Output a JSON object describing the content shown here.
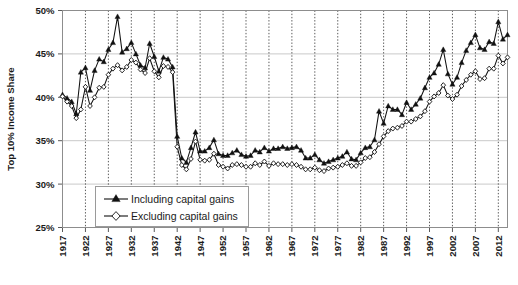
{
  "chart_data": {
    "type": "line",
    "title": "",
    "xlabel": "",
    "ylabel": "Top 10% Income Share",
    "xlim": [
      1917,
      2014
    ],
    "ylim": [
      25,
      50
    ],
    "ytick_labels": [
      "25%",
      "30%",
      "35%",
      "40%",
      "45%",
      "50%"
    ],
    "ytick_values": [
      25,
      30,
      35,
      40,
      45,
      50
    ],
    "xtick_labels": [
      "1917",
      "1922",
      "1927",
      "1932",
      "1937",
      "1942",
      "1947",
      "1952",
      "1957",
      "1962",
      "1967",
      "1972",
      "1977",
      "1982",
      "1987",
      "1992",
      "1997",
      "2002",
      "2007",
      "2012"
    ],
    "xtick_values": [
      1917,
      1922,
      1927,
      1932,
      1937,
      1942,
      1947,
      1952,
      1957,
      1962,
      1967,
      1972,
      1977,
      1982,
      1987,
      1992,
      1997,
      2002,
      2007,
      2012
    ],
    "grid": {
      "horizontal": true,
      "vertical": true,
      "vertical_style": "dotted"
    },
    "legend_position": "lower-left-inside",
    "x": [
      1917,
      1918,
      1919,
      1920,
      1921,
      1922,
      1923,
      1924,
      1925,
      1926,
      1927,
      1928,
      1929,
      1930,
      1931,
      1932,
      1933,
      1934,
      1935,
      1936,
      1937,
      1938,
      1939,
      1940,
      1941,
      1942,
      1943,
      1944,
      1945,
      1946,
      1947,
      1948,
      1949,
      1950,
      1951,
      1952,
      1953,
      1954,
      1955,
      1956,
      1957,
      1958,
      1959,
      1960,
      1961,
      1962,
      1963,
      1964,
      1965,
      1966,
      1967,
      1968,
      1969,
      1970,
      1971,
      1972,
      1973,
      1974,
      1975,
      1976,
      1977,
      1978,
      1979,
      1980,
      1981,
      1982,
      1983,
      1984,
      1985,
      1986,
      1987,
      1988,
      1989,
      1990,
      1991,
      1992,
      1993,
      1994,
      1995,
      1996,
      1997,
      1998,
      1999,
      2000,
      2001,
      2002,
      2003,
      2004,
      2005,
      2006,
      2007,
      2008,
      2009,
      2010,
      2011,
      2012,
      2013,
      2014
    ],
    "series": [
      {
        "name": "Including capital gains",
        "marker": "filled-triangle",
        "values": [
          40.3,
          39.9,
          39.5,
          38.1,
          42.9,
          43.4,
          40.8,
          43.1,
          44.4,
          44.1,
          45.5,
          46.3,
          49.3,
          45.2,
          45.6,
          46.3,
          45.0,
          43.7,
          43.4,
          46.2,
          44.7,
          43.0,
          44.6,
          44.4,
          43.5,
          35.5,
          33.0,
          32.5,
          34.2,
          36.0,
          33.8,
          33.8,
          34.2,
          35.1,
          33.5,
          33.3,
          33.3,
          33.6,
          33.9,
          33.4,
          33.2,
          33.3,
          33.9,
          33.7,
          34.2,
          33.8,
          34.1,
          34.1,
          34.3,
          34.1,
          34.2,
          34.3,
          33.9,
          33.0,
          33.0,
          33.4,
          32.8,
          32.4,
          32.6,
          32.8,
          33.0,
          33.2,
          33.7,
          32.9,
          32.8,
          33.6,
          34.2,
          34.3,
          35.1,
          38.4,
          37.0,
          39.0,
          38.6,
          38.6,
          38.0,
          39.4,
          38.6,
          39.2,
          39.9,
          41.1,
          42.3,
          42.8,
          43.8,
          45.5,
          42.7,
          41.5,
          42.3,
          44.0,
          45.4,
          46.3,
          47.2,
          45.7,
          45.5,
          46.4,
          46.2,
          48.7,
          46.7,
          47.2
        ]
      },
      {
        "name": "Excluding capital gains",
        "marker": "open-diamond",
        "values": [
          40.1,
          39.5,
          39.0,
          37.6,
          38.6,
          41.2,
          39.0,
          40.0,
          41.1,
          41.2,
          42.6,
          43.3,
          43.7,
          43.1,
          43.5,
          44.3,
          44.0,
          43.2,
          42.8,
          44.5,
          43.0,
          42.3,
          43.6,
          43.5,
          42.9,
          34.3,
          32.2,
          31.7,
          32.9,
          34.9,
          32.8,
          32.7,
          32.8,
          33.5,
          32.2,
          32.0,
          31.8,
          32.2,
          32.3,
          32.2,
          32.0,
          32.0,
          32.4,
          32.2,
          32.6,
          32.1,
          32.4,
          32.3,
          32.3,
          32.2,
          32.3,
          32.2,
          32.0,
          31.7,
          31.7,
          31.9,
          31.6,
          31.5,
          31.8,
          31.9,
          32.0,
          32.2,
          32.4,
          32.1,
          32.1,
          32.5,
          33.0,
          33.1,
          33.7,
          34.6,
          35.5,
          36.1,
          36.4,
          36.5,
          36.7,
          37.2,
          37.2,
          37.5,
          37.8,
          38.4,
          39.5,
          40.1,
          40.5,
          41.4,
          40.2,
          39.8,
          40.3,
          41.3,
          42.0,
          42.6,
          43.0,
          42.1,
          42.2,
          43.3,
          43.3,
          44.8,
          43.9,
          44.6
        ]
      }
    ]
  },
  "legend": {
    "entries": [
      {
        "label": "Including capital gains"
      },
      {
        "label": "Excluding capital gains"
      }
    ]
  },
  "axes": {
    "y_title": "Top 10% Income Share"
  }
}
